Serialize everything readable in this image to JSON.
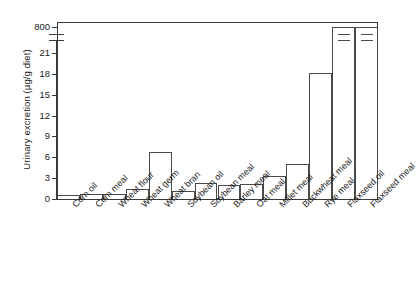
{
  "chart_data": {
    "type": "bar",
    "title": "",
    "xlabel": "",
    "ylabel": "Urinary excretion (µg/g diet)",
    "categories": [
      "Corn oil",
      "Corn meal",
      "Wheat flour",
      "Wheat germ",
      "Wheat bran",
      "Soybean oil",
      "Soybean meal",
      "Barley meal",
      "Oat meal",
      "Millet meal",
      "Buckwheat meal",
      "Rye meal",
      "Flaxseed oil",
      "Flaxseed meal"
    ],
    "values": [
      0.6,
      0.7,
      0.7,
      1.4,
      6.7,
      1.1,
      2.3,
      2.0,
      2.2,
      3.3,
      5.0,
      18.2,
      790,
      800
    ],
    "ytick_labels": [
      "0",
      "3",
      "6",
      "9",
      "12",
      "15",
      "18",
      "21",
      "800"
    ],
    "ytick_values": [
      0,
      3,
      6,
      9,
      12,
      15,
      18,
      21,
      800
    ],
    "ylim": [
      0,
      800
    ],
    "axis_break": true,
    "axis_break_between": [
      21,
      800
    ],
    "grid": false,
    "legend": false,
    "bar_style": "hollow-outline"
  },
  "axis": {
    "y_title": "Urinary excretion (µg/g diet)"
  }
}
